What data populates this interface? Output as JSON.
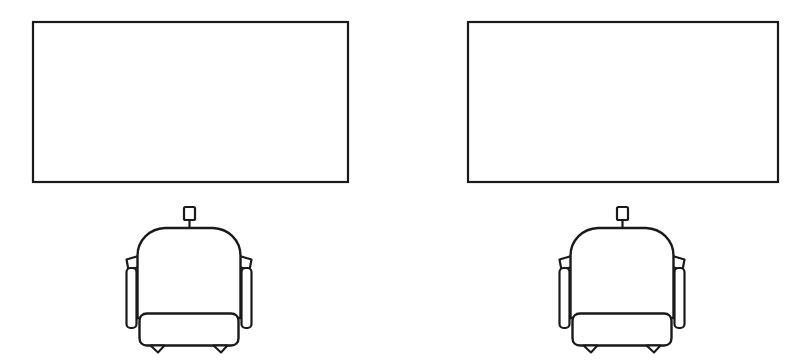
{
  "figure": {
    "background_color": "#ffffff",
    "line_color": "#1a1a1a",
    "width": 803,
    "height": 364,
    "style": "black-and-white technical line drawing"
  },
  "panels": [
    {
      "name": "left-display-panel",
      "label": "",
      "x": 33,
      "y": 22,
      "width": 315,
      "height": 160,
      "fill": "#ffffff",
      "stroke": "#1a1a1a",
      "stroke_width": 2.2,
      "corner": "square"
    },
    {
      "name": "right-display-panel",
      "label": "",
      "x": 468,
      "y": 22,
      "width": 310,
      "height": 160,
      "fill": "#ffffff",
      "stroke": "#1a1a1a",
      "stroke_width": 2.2,
      "corner": "square"
    }
  ],
  "chairs": [
    {
      "name": "left-armchair",
      "label": "",
      "center_x": 189,
      "top_y": 207,
      "bottom_y": 352,
      "backrest": {
        "left": 137,
        "right": 241,
        "top": 228,
        "bottom": 318
      },
      "headrest_tab": {
        "x": 184,
        "y": 207,
        "width": 11,
        "height": 13
      },
      "seat_cushion": {
        "left": 140,
        "right": 238,
        "top": 313,
        "bottom": 345
      },
      "armrests": 2,
      "legs": 2
    },
    {
      "name": "right-armchair",
      "label": "",
      "center_x": 622,
      "top_y": 207,
      "bottom_y": 352,
      "backrest": {
        "left": 570,
        "right": 674,
        "top": 228,
        "bottom": 318
      },
      "headrest_tab": {
        "x": 617,
        "y": 207,
        "width": 11,
        "height": 13
      },
      "seat_cushion": {
        "left": 573,
        "right": 671,
        "top": 313,
        "bottom": 345
      },
      "armrests": 2,
      "legs": 2
    }
  ],
  "annotations": {
    "text_items": [],
    "note": "No visible text labels in the drawing"
  }
}
